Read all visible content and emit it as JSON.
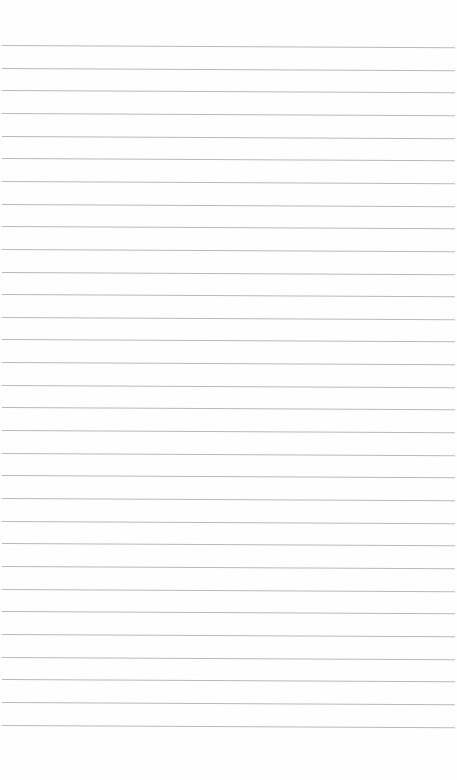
{
  "page": {
    "type": "ruled-paper",
    "background_color": "#fefefe",
    "line_color": "#b9b9b9",
    "line_count": 31,
    "first_line_y": 45,
    "line_spacing": 22.65,
    "text": ""
  }
}
